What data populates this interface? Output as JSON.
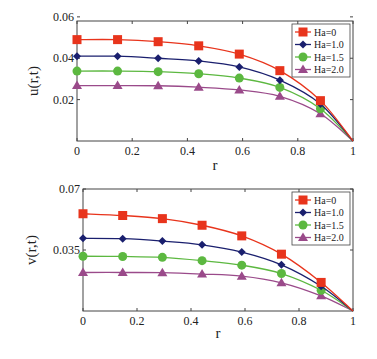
{
  "chart_data": [
    {
      "type": "line",
      "title": "",
      "xlabel": "r",
      "ylabel": "u(r,t)",
      "xlim": [
        0,
        1
      ],
      "ylim": [
        0,
        0.058
      ],
      "xticks": [
        "0",
        "0.2",
        "0.4",
        "0.6",
        "0.8",
        "1"
      ],
      "yticks": [
        "0.02",
        "0.04",
        "0.06"
      ],
      "grid": false,
      "legend_position": "upper right",
      "x": [
        0,
        0.147,
        0.294,
        0.441,
        0.588,
        0.735,
        0.882,
        1.0
      ],
      "series": [
        {
          "name": "Ha=0",
          "color": "#e8341c",
          "marker": "square",
          "values": [
            0.049,
            0.049,
            0.048,
            0.046,
            0.042,
            0.034,
            0.0195,
            0
          ]
        },
        {
          "name": "Ha=1.0",
          "color": "#1a1f6e",
          "marker": "diamond",
          "values": [
            0.041,
            0.041,
            0.04,
            0.0387,
            0.0358,
            0.0294,
            0.0179,
            0
          ]
        },
        {
          "name": "Ha=1.5",
          "color": "#5cb840",
          "marker": "circle",
          "values": [
            0.0338,
            0.0338,
            0.0335,
            0.0325,
            0.0304,
            0.0259,
            0.0156,
            0
          ]
        },
        {
          "name": "Ha=2.0",
          "color": "#9a4a8a",
          "marker": "triangle",
          "values": [
            0.0268,
            0.0268,
            0.0267,
            0.026,
            0.0247,
            0.0216,
            0.0132,
            0
          ]
        }
      ]
    },
    {
      "type": "line",
      "title": "",
      "xlabel": "r",
      "ylabel": "v(r,t)",
      "xlim": [
        0,
        1
      ],
      "ylim": [
        0,
        0.07
      ],
      "xticks": [
        "0",
        "0.2",
        "0.4",
        "0.6",
        "0.8",
        "1"
      ],
      "yticks": [
        "0.035",
        "0.07"
      ],
      "grid": false,
      "legend_position": "upper right",
      "x": [
        0,
        0.147,
        0.294,
        0.441,
        0.588,
        0.735,
        0.882,
        1.0
      ],
      "series": [
        {
          "name": "Ha=0",
          "color": "#e8341c",
          "marker": "square",
          "values": [
            0.0558,
            0.0548,
            0.053,
            0.0492,
            0.0431,
            0.0326,
            0.0164,
            0
          ]
        },
        {
          "name": "Ha=1.0",
          "color": "#1a1f6e",
          "marker": "diamond",
          "values": [
            0.0417,
            0.0415,
            0.0401,
            0.038,
            0.0338,
            0.0265,
            0.0142,
            0
          ]
        },
        {
          "name": "Ha=1.5",
          "color": "#5cb840",
          "marker": "circle",
          "values": [
            0.0314,
            0.0313,
            0.0308,
            0.0289,
            0.0263,
            0.0215,
            0.0119,
            0
          ]
        },
        {
          "name": "Ha=2.0",
          "color": "#9a4a8a",
          "marker": "triangle",
          "values": [
            0.0221,
            0.0221,
            0.022,
            0.0212,
            0.02,
            0.0162,
            0.0087,
            0
          ]
        }
      ]
    }
  ]
}
